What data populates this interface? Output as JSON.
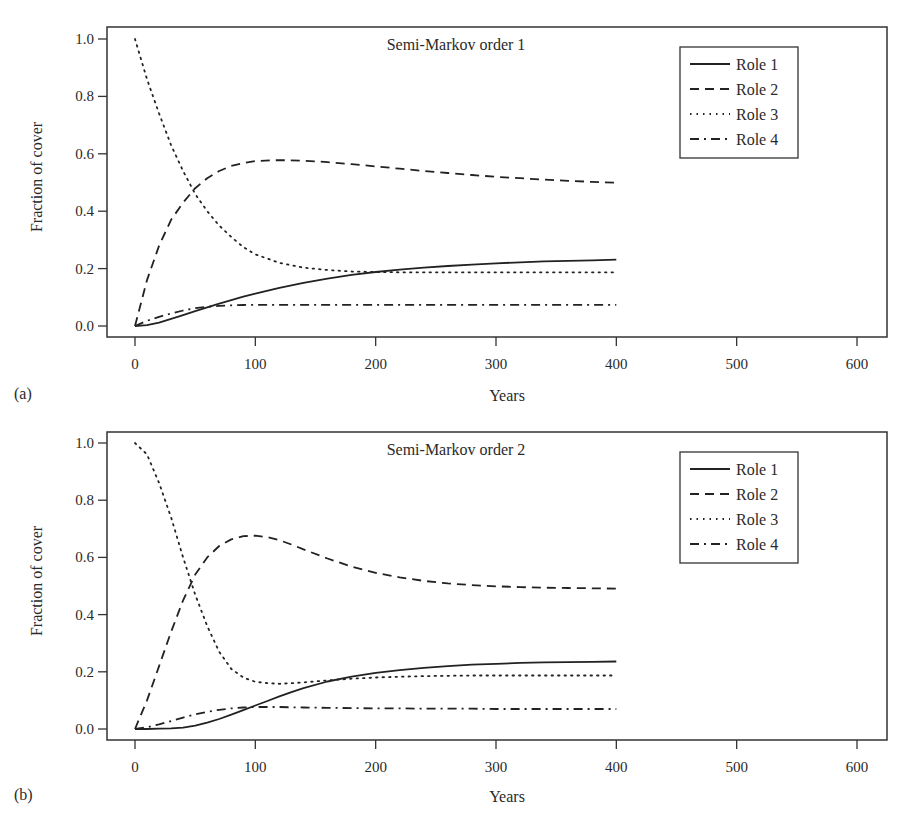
{
  "chart_data": [
    {
      "panel_label": "(a)",
      "type": "line",
      "title": "Semi-Markov order 1",
      "xlabel": "Years",
      "ylabel": "Fraction of cover",
      "xlim": [
        -25,
        625
      ],
      "ylim": [
        -0.03,
        1.03
      ],
      "xticks": [
        "0",
        "100",
        "200",
        "300",
        "400",
        "500",
        "600"
      ],
      "yticks": [
        "0.0",
        "0.2",
        "0.4",
        "0.6",
        "0.8",
        "1.0"
      ],
      "grid": false,
      "legend_position": "top-right",
      "x": [
        0,
        10,
        20,
        30,
        40,
        50,
        60,
        70,
        80,
        90,
        100,
        120,
        140,
        160,
        180,
        200,
        220,
        240,
        260,
        280,
        300,
        320,
        340,
        360,
        380,
        400
      ],
      "series": [
        {
          "name": "Role 1",
          "style": "solid",
          "values": [
            0.0,
            0.003,
            0.012,
            0.025,
            0.038,
            0.052,
            0.065,
            0.078,
            0.09,
            0.102,
            0.113,
            0.133,
            0.15,
            0.165,
            0.178,
            0.188,
            0.196,
            0.203,
            0.209,
            0.214,
            0.218,
            0.222,
            0.225,
            0.227,
            0.229,
            0.231
          ]
        },
        {
          "name": "Role 2",
          "style": "dashed",
          "values": [
            0.0,
            0.16,
            0.28,
            0.37,
            0.43,
            0.48,
            0.515,
            0.54,
            0.558,
            0.568,
            0.575,
            0.578,
            0.576,
            0.571,
            0.564,
            0.556,
            0.548,
            0.54,
            0.533,
            0.526,
            0.52,
            0.515,
            0.51,
            0.506,
            0.502,
            0.499
          ]
        },
        {
          "name": "Role 3",
          "style": "dotted",
          "values": [
            1.0,
            0.86,
            0.74,
            0.63,
            0.54,
            0.46,
            0.4,
            0.35,
            0.31,
            0.275,
            0.25,
            0.22,
            0.203,
            0.195,
            0.19,
            0.188,
            0.187,
            0.187,
            0.187,
            0.187,
            0.187,
            0.187,
            0.187,
            0.187,
            0.187,
            0.187
          ]
        },
        {
          "name": "Role 4",
          "style": "dashdot",
          "values": [
            0.0,
            0.018,
            0.032,
            0.044,
            0.054,
            0.062,
            0.067,
            0.07,
            0.072,
            0.073,
            0.074,
            0.074,
            0.074,
            0.074,
            0.074,
            0.074,
            0.074,
            0.074,
            0.074,
            0.074,
            0.074,
            0.074,
            0.074,
            0.074,
            0.074,
            0.074
          ]
        }
      ]
    },
    {
      "panel_label": "(b)",
      "type": "line",
      "title": "Semi-Markov order 2",
      "xlabel": "Years",
      "ylabel": "Fraction of cover",
      "xlim": [
        -25,
        625
      ],
      "ylim": [
        -0.03,
        1.03
      ],
      "xticks": [
        "0",
        "100",
        "200",
        "300",
        "400",
        "500",
        "600"
      ],
      "yticks": [
        "0.0",
        "0.2",
        "0.4",
        "0.6",
        "0.8",
        "1.0"
      ],
      "grid": false,
      "legend_position": "top-right",
      "x": [
        0,
        10,
        20,
        30,
        40,
        50,
        60,
        70,
        80,
        90,
        100,
        110,
        120,
        130,
        140,
        160,
        180,
        200,
        220,
        240,
        260,
        280,
        300,
        320,
        340,
        360,
        380,
        400
      ],
      "series": [
        {
          "name": "Role 1",
          "style": "solid",
          "values": [
            0.0,
            0.0,
            0.001,
            0.002,
            0.005,
            0.012,
            0.022,
            0.035,
            0.05,
            0.066,
            0.082,
            0.098,
            0.114,
            0.129,
            0.143,
            0.166,
            0.183,
            0.196,
            0.206,
            0.214,
            0.22,
            0.225,
            0.228,
            0.231,
            0.233,
            0.234,
            0.235,
            0.236
          ]
        },
        {
          "name": "Role 2",
          "style": "dashed",
          "values": [
            0.0,
            0.1,
            0.22,
            0.34,
            0.45,
            0.54,
            0.6,
            0.64,
            0.663,
            0.674,
            0.676,
            0.671,
            0.66,
            0.645,
            0.628,
            0.596,
            0.568,
            0.546,
            0.53,
            0.518,
            0.509,
            0.503,
            0.499,
            0.496,
            0.494,
            0.493,
            0.492,
            0.491
          ]
        },
        {
          "name": "Role 3",
          "style": "dotted",
          "values": [
            1.0,
            0.96,
            0.86,
            0.74,
            0.6,
            0.47,
            0.36,
            0.27,
            0.21,
            0.18,
            0.165,
            0.16,
            0.158,
            0.16,
            0.163,
            0.17,
            0.176,
            0.18,
            0.183,
            0.185,
            0.186,
            0.187,
            0.187,
            0.187,
            0.187,
            0.187,
            0.187,
            0.187
          ]
        },
        {
          "name": "Role 4",
          "style": "dashdot",
          "values": [
            0.0,
            0.006,
            0.016,
            0.028,
            0.04,
            0.051,
            0.06,
            0.067,
            0.072,
            0.075,
            0.077,
            0.077,
            0.077,
            0.076,
            0.075,
            0.074,
            0.073,
            0.072,
            0.072,
            0.071,
            0.071,
            0.071,
            0.07,
            0.07,
            0.07,
            0.07,
            0.07,
            0.07
          ]
        }
      ]
    }
  ],
  "panels": [
    {
      "label": "(a)",
      "title": "Semi-Markov order 1",
      "xlabel": "Years",
      "ylabel": "Fraction of cover"
    },
    {
      "label": "(b)",
      "title": "Semi-Markov order 2",
      "xlabel": "Years",
      "ylabel": "Fraction of cover"
    }
  ],
  "legend": [
    "Role 1",
    "Role 2",
    "Role 3",
    "Role 4"
  ],
  "colors": {
    "ink": "#222222",
    "background": "#ffffff"
  }
}
